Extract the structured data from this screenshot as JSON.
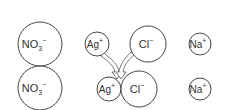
{
  "diagram": {
    "type": "ion-precipitation",
    "stroke_color": "#444444",
    "text_color": "#333333",
    "background": "#ffffff",
    "top_row": [
      {
        "id": "no3-top",
        "base": "NO",
        "sub": "3",
        "sup": "−"
      },
      {
        "id": "ag-top",
        "base": "Ag",
        "sub": "",
        "sup": "+"
      },
      {
        "id": "cl-top",
        "base": "Cl",
        "sub": "",
        "sup": "−"
      },
      {
        "id": "na-top",
        "base": "Na",
        "sub": "",
        "sup": "+"
      }
    ],
    "bottom_row": [
      {
        "id": "no3-bottom",
        "base": "NO",
        "sub": "3",
        "sup": "−"
      },
      {
        "id": "ag-bottom",
        "base": "Ag",
        "sub": "",
        "sup": "+"
      },
      {
        "id": "cl-bottom",
        "base": "Cl",
        "sub": "",
        "sup": "−"
      },
      {
        "id": "na-bottom",
        "base": "Na",
        "sub": "",
        "sup": "+"
      }
    ],
    "arrows": [
      {
        "from": "ag-top",
        "to": "ag-cl-pair",
        "icon": "curved-arrow-icon"
      },
      {
        "from": "cl-top",
        "to": "ag-cl-pair",
        "icon": "curved-arrow-icon"
      }
    ]
  }
}
